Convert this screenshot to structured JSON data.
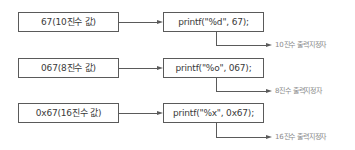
{
  "rows": [
    {
      "value_label": "67(10진수 값)",
      "code": "printf(\"%d\", 67);",
      "note": "10진수 출력지정자"
    },
    {
      "value_label": "067(8진수 값)",
      "code": "printf(\"%o\", 067);",
      "note": "8진수 출력지정자"
    },
    {
      "value_label": "0x67(16진수 값)",
      "code": "printf(\"%x\", 0x67);",
      "note": "16진수 출력지정자"
    }
  ],
  "colors": {
    "line": "#5a5a5a",
    "note_text": "#8a8a8a",
    "box_text": "#3a3a3a"
  }
}
